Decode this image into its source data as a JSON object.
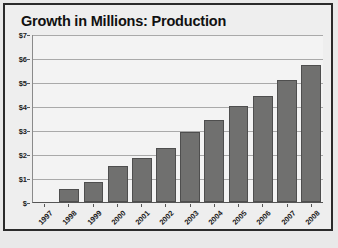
{
  "chart_data": {
    "type": "bar",
    "title": "Growth in Millions: Production",
    "xlabel": "",
    "ylabel": "",
    "categories": [
      "1997",
      "1998",
      "1999",
      "2000",
      "2001",
      "2002",
      "2003",
      "2004",
      "2005",
      "2006",
      "2007",
      "2008"
    ],
    "values": [
      0,
      0.55,
      0.85,
      1.5,
      1.85,
      2.25,
      2.9,
      3.4,
      4.0,
      4.4,
      5.1,
      5.7
    ],
    "series": [
      {
        "name": "Production",
        "values": [
          0,
          0.55,
          0.85,
          1.5,
          1.85,
          2.25,
          2.9,
          3.4,
          4.0,
          4.4,
          5.1,
          5.7
        ]
      }
    ],
    "ylim": [
      0,
      7
    ],
    "y_tick_values": [
      0,
      1,
      2,
      3,
      4,
      5,
      6,
      7
    ],
    "y_tick_labels": [
      "$",
      "$1",
      "$2",
      "$3",
      "$4",
      "$5",
      "$6",
      "$7"
    ],
    "grid": true,
    "legend": false,
    "legend_position": "none",
    "bar_color": "#70706f",
    "bar_border_color": "#4e4e4e",
    "plot_background": "#f3f3f3",
    "gridline_color": "#a9a9a9",
    "frame_color": "#2b2b2b",
    "title_color": "#111111"
  }
}
